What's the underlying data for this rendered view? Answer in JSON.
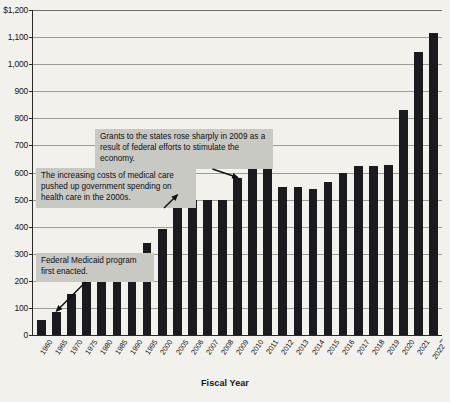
{
  "chart_data": {
    "type": "bar",
    "title": "",
    "xlabel": "Fiscal Year",
    "ylabel": "",
    "ylim": [
      0,
      1200
    ],
    "grid": true,
    "legend": "none",
    "y_ticks": [
      {
        "value": 1200,
        "label": "$1,200"
      },
      {
        "value": 1100,
        "label": "1,100"
      },
      {
        "value": 1000,
        "label": "1,000"
      },
      {
        "value": 900,
        "label": "900"
      },
      {
        "value": 800,
        "label": "800"
      },
      {
        "value": 700,
        "label": "700"
      },
      {
        "value": 600,
        "label": "600"
      },
      {
        "value": 500,
        "label": "500"
      },
      {
        "value": 400,
        "label": "400"
      },
      {
        "value": 300,
        "label": "300"
      },
      {
        "value": 200,
        "label": "200"
      },
      {
        "value": 100,
        "label": "100"
      },
      {
        "value": 0,
        "label": "0"
      }
    ],
    "categories": [
      "1960",
      "1965",
      "1970",
      "1975",
      "1980",
      "1985",
      "1990",
      "1995",
      "2000",
      "2005",
      "2006",
      "2007",
      "2008",
      "2009",
      "2010",
      "2011",
      "2012",
      "2013",
      "2014",
      "2015",
      "2016",
      "2017",
      "2018",
      "2019",
      "2020",
      "2021",
      "2022"
    ],
    "category_labels": [
      "1960",
      "1965",
      "1970",
      "1975",
      "1980",
      "1985",
      "1990",
      "1995",
      "2000",
      "2005",
      "2006",
      "2007",
      "2008",
      "2009",
      "2010",
      "2011",
      "2012",
      "2013",
      "2014",
      "2015",
      "2016",
      "2017",
      "2018",
      "2019",
      "2020",
      "2021",
      "2022**"
    ],
    "values": [
      55,
      85,
      150,
      230,
      285,
      230,
      240,
      340,
      390,
      513,
      500,
      497,
      497,
      578,
      638,
      622,
      548,
      548,
      540,
      565,
      600,
      625,
      625,
      628,
      830,
      1045,
      1115
    ],
    "annotations": [
      {
        "text": "Federal Medicaid program first enacted.",
        "target_category": "1965"
      },
      {
        "text": "The increasing costs of medical care pushed up government spending on health care in the 2000s.",
        "target_category": "2005"
      },
      {
        "text": "Grants to the states rose sharply in 2009 as a result of federal efforts to stimulate the economy.",
        "target_category": "2009"
      }
    ],
    "colors": {
      "bar": "#1b1b1f",
      "background": "#f2f1ec",
      "gridline": "#9b9b97",
      "annotation_box": "#c9c9c4",
      "axis": "#2a2a2a"
    }
  }
}
